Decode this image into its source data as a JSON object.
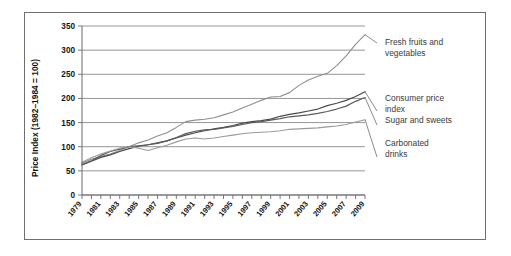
{
  "figure": {
    "border_color": "#6f6f6f",
    "background": "#ffffff"
  },
  "chart_data": {
    "type": "line",
    "title": "",
    "xlabel": "",
    "ylabel": "Price Index (1982–1984 = 100)",
    "ylim": [
      0,
      350
    ],
    "yticks": [
      0,
      50,
      100,
      150,
      200,
      250,
      300,
      350
    ],
    "ytick_labels": [
      "0",
      "50",
      "100",
      "150",
      "200",
      "250",
      "300",
      "350"
    ],
    "xlim": [
      1979,
      2009
    ],
    "x": [
      1979,
      1980,
      1981,
      1982,
      1983,
      1984,
      1985,
      1986,
      1987,
      1988,
      1989,
      1990,
      1991,
      1992,
      1993,
      1994,
      1995,
      1996,
      1997,
      1998,
      1999,
      2000,
      2001,
      2002,
      2003,
      2004,
      2005,
      2006,
      2007,
      2008,
      2009
    ],
    "xtick_labels": [
      "1979",
      "1981",
      "1983",
      "1985",
      "1987",
      "1989",
      "1991",
      "1993",
      "1995",
      "1997",
      "1999",
      "2001",
      "2003",
      "2005",
      "2007",
      "2009"
    ],
    "xtick_label_years": [
      1979,
      1981,
      1983,
      1985,
      1987,
      1989,
      1991,
      1993,
      1995,
      1997,
      1999,
      2001,
      2003,
      2005,
      2007,
      2009
    ],
    "grid": "horizontal",
    "legend_position": "right-inline-labels",
    "series": [
      {
        "name": "Fresh fruits and vegetables",
        "color": "#8f8f8f",
        "width": 1.1,
        "label_lines": [
          "Fresh fruits and",
          "vegetables"
        ],
        "values": [
          66,
          74,
          80,
          85,
          92,
          100,
          108,
          114,
          122,
          129,
          140,
          152,
          155,
          157,
          160,
          166,
          172,
          180,
          188,
          196,
          203,
          204,
          212,
          227,
          238,
          246,
          252,
          268,
          288,
          312,
          332
        ]
      },
      {
        "name": "Consumer price index",
        "color": "#4a4a4a",
        "width": 1.2,
        "label_lines": [
          "Consumer price",
          "index"
        ],
        "values": [
          62,
          70,
          78,
          83,
          90,
          96,
          101,
          104,
          108,
          112,
          118,
          124,
          129,
          133,
          137,
          140,
          144,
          149,
          152,
          154,
          157,
          163,
          167,
          170,
          174,
          178,
          185,
          190,
          196,
          204,
          214
        ]
      },
      {
        "name": "Sugar and sweets",
        "color": "#5b5b5b",
        "width": 1.2,
        "label_lines": [
          "Sugar and sweets"
        ],
        "values": [
          63,
          71,
          82,
          90,
          95,
          100,
          102,
          104,
          107,
          112,
          119,
          127,
          132,
          135,
          136,
          139,
          142,
          146,
          150,
          152,
          155,
          158,
          162,
          164,
          166,
          169,
          173,
          178,
          184,
          194,
          202
        ]
      },
      {
        "name": "Carbonated drinks",
        "color": "#9a9a9a",
        "width": 1.1,
        "label_lines": [
          "Carbonated",
          "drinks"
        ],
        "values": [
          68,
          77,
          85,
          91,
          97,
          100,
          97,
          92,
          98,
          103,
          110,
          116,
          118,
          116,
          118,
          121,
          124,
          127,
          129,
          130,
          131,
          133,
          136,
          137,
          138,
          139,
          141,
          143,
          146,
          151,
          156
        ]
      }
    ],
    "annotations": [
      {
        "text": "Fresh fruits and vegetables",
        "series": "Fresh fruits and vegetables"
      },
      {
        "text": "Consumer price index",
        "series": "Consumer price index"
      },
      {
        "text": "Sugar and sweets",
        "series": "Sugar and sweets"
      },
      {
        "text": "Carbonated drinks",
        "series": "Carbonated drinks"
      }
    ]
  }
}
